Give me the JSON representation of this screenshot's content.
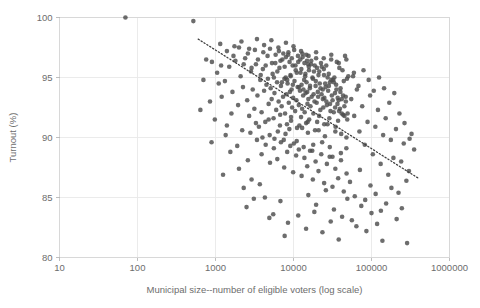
{
  "chart_data": {
    "type": "scatter",
    "title": "",
    "xlabel": "Municipal size--number of eligible voters (log scale)",
    "ylabel": "Turnout (%)",
    "xscale": "log",
    "yscale": "linear",
    "xlim": [
      10,
      1000000
    ],
    "ylim": [
      80,
      100
    ],
    "grid": true,
    "legend": null,
    "xticks": [
      10,
      100,
      1000,
      10000,
      100000,
      1000000
    ],
    "xtick_labels": [
      "10",
      "100",
      "1000",
      "10000",
      "100000",
      "1000000"
    ],
    "yticks": [
      80,
      85,
      90,
      95,
      100
    ],
    "ytick_labels": [
      "80",
      "95",
      "90",
      "95",
      "100"
    ],
    "ytick_labels_display": [
      "80",
      "85",
      "90",
      "95",
      "100"
    ],
    "marker": {
      "shape": "circle",
      "color": "#4d4d4d",
      "opacity": 0.82,
      "size_px": 4.6
    },
    "trendline": {
      "style": "dotted",
      "color": "#3d3d3d",
      "x_start": 600,
      "y_start": 98.2,
      "x_end": 400000,
      "y_end": 86.6,
      "description": "negative linear fit on log(size)"
    },
    "points": [
      [
        70,
        100.0
      ],
      [
        520,
        99.7
      ],
      [
        900,
        96.3
      ],
      [
        1050,
        95.4
      ],
      [
        1180,
        96.0
      ],
      [
        1320,
        94.7
      ],
      [
        1500,
        95.9
      ],
      [
        1650,
        93.8
      ],
      [
        1800,
        96.4
      ],
      [
        1950,
        92.7
      ],
      [
        2100,
        95.1
      ],
      [
        2250,
        94.2
      ],
      [
        2400,
        96.6
      ],
      [
        2550,
        93.1
      ],
      [
        2700,
        91.8
      ],
      [
        2850,
        95.5
      ],
      [
        3000,
        94.0
      ],
      [
        3150,
        92.4
      ],
      [
        3300,
        96.1
      ],
      [
        3450,
        93.5
      ],
      [
        3600,
        90.9
      ],
      [
        3750,
        94.8
      ],
      [
        3900,
        92.1
      ],
      [
        4050,
        95.7
      ],
      [
        4200,
        93.9
      ],
      [
        4350,
        91.3
      ],
      [
        4500,
        94.4
      ],
      [
        4650,
        96.8
      ],
      [
        4800,
        92.8
      ],
      [
        4950,
        90.2
      ],
      [
        5100,
        94.1
      ],
      [
        5250,
        93.2
      ],
      [
        5400,
        95.3
      ],
      [
        5550,
        91.6
      ],
      [
        5700,
        93.7
      ],
      [
        5850,
        96.2
      ],
      [
        6000,
        92.3
      ],
      [
        6150,
        94.6
      ],
      [
        6300,
        90.5
      ],
      [
        6450,
        93.0
      ],
      [
        6600,
        95.8
      ],
      [
        6750,
        91.9
      ],
      [
        6900,
        94.3
      ],
      [
        7050,
        92.6
      ],
      [
        7200,
        96.5
      ],
      [
        7350,
        93.4
      ],
      [
        7500,
        89.8
      ],
      [
        7650,
        94.9
      ],
      [
        7800,
        92.0
      ],
      [
        7950,
        95.0
      ],
      [
        8100,
        93.6
      ],
      [
        8250,
        91.1
      ],
      [
        8400,
        94.5
      ],
      [
        8550,
        96.9
      ],
      [
        8700,
        92.9
      ],
      [
        8850,
        90.7
      ],
      [
        9000,
        93.8
      ],
      [
        9150,
        95.2
      ],
      [
        9300,
        91.4
      ],
      [
        9450,
        94.0
      ],
      [
        9600,
        92.5
      ],
      [
        9750,
        96.0
      ],
      [
        9900,
        93.3
      ],
      [
        10100,
        89.5
      ],
      [
        10300,
        94.7
      ],
      [
        10500,
        92.2
      ],
      [
        10700,
        95.6
      ],
      [
        10900,
        93.1
      ],
      [
        11100,
        90.8
      ],
      [
        11300,
        94.2
      ],
      [
        11500,
        96.3
      ],
      [
        11700,
        92.7
      ],
      [
        11900,
        91.0
      ],
      [
        12100,
        93.9
      ],
      [
        12300,
        95.4
      ],
      [
        12500,
        91.7
      ],
      [
        12700,
        94.4
      ],
      [
        12900,
        92.4
      ],
      [
        13100,
        96.7
      ],
      [
        13300,
        93.5
      ],
      [
        13500,
        89.2
      ],
      [
        13700,
        94.8
      ],
      [
        13900,
        92.1
      ],
      [
        14100,
        95.1
      ],
      [
        14300,
        93.7
      ],
      [
        14500,
        91.2
      ],
      [
        14700,
        94.6
      ],
      [
        14900,
        96.4
      ],
      [
        15100,
        92.8
      ],
      [
        15300,
        90.4
      ],
      [
        15500,
        93.2
      ],
      [
        15700,
        95.9
      ],
      [
        15900,
        91.5
      ],
      [
        16200,
        94.1
      ],
      [
        16500,
        92.6
      ],
      [
        16800,
        96.1
      ],
      [
        17100,
        93.4
      ],
      [
        17400,
        88.9
      ],
      [
        17700,
        94.9
      ],
      [
        18000,
        92.0
      ],
      [
        18300,
        95.5
      ],
      [
        18600,
        93.0
      ],
      [
        18900,
        90.6
      ],
      [
        19200,
        94.3
      ],
      [
        19500,
        96.6
      ],
      [
        19800,
        92.9
      ],
      [
        20100,
        91.3
      ],
      [
        20500,
        93.8
      ],
      [
        20900,
        95.2
      ],
      [
        21300,
        91.8
      ],
      [
        21700,
        94.5
      ],
      [
        22100,
        92.3
      ],
      [
        22500,
        96.2
      ],
      [
        22900,
        93.6
      ],
      [
        23300,
        89.6
      ],
      [
        23700,
        94.0
      ],
      [
        24100,
        92.5
      ],
      [
        24500,
        95.7
      ],
      [
        24900,
        93.3
      ],
      [
        25300,
        90.1
      ],
      [
        25800,
        94.2
      ],
      [
        26300,
        96.0
      ],
      [
        26800,
        92.7
      ],
      [
        27300,
        91.1
      ],
      [
        27800,
        93.9
      ],
      [
        28300,
        95.3
      ],
      [
        28800,
        91.6
      ],
      [
        29300,
        94.6
      ],
      [
        29800,
        92.2
      ],
      [
        30400,
        96.5
      ],
      [
        31000,
        93.5
      ],
      [
        31600,
        88.4
      ],
      [
        32200,
        94.8
      ],
      [
        32800,
        92.1
      ],
      [
        33400,
        95.0
      ],
      [
        34000,
        93.7
      ],
      [
        34600,
        90.9
      ],
      [
        35200,
        94.4
      ],
      [
        35900,
        96.3
      ],
      [
        36600,
        92.8
      ],
      [
        37300,
        91.4
      ],
      [
        38000,
        93.1
      ],
      [
        38700,
        95.8
      ],
      [
        39400,
        92.4
      ],
      [
        40100,
        94.1
      ],
      [
        40900,
        90.3
      ],
      [
        41700,
        93.2
      ],
      [
        42500,
        95.6
      ],
      [
        43300,
        91.9
      ],
      [
        44100,
        94.7
      ],
      [
        44900,
        92.6
      ],
      [
        45800,
        96.8
      ],
      [
        46700,
        93.4
      ],
      [
        47600,
        89.1
      ],
      [
        48500,
        94.9
      ],
      [
        49400,
        92.0
      ],
      [
        50400,
        95.1
      ],
      [
        1400,
        97.2
      ],
      [
        1700,
        96.8
      ],
      [
        2000,
        97.5
      ],
      [
        2300,
        96.1
      ],
      [
        2600,
        97.0
      ],
      [
        2900,
        95.8
      ],
      [
        3200,
        97.3
      ],
      [
        3500,
        96.5
      ],
      [
        3800,
        95.2
      ],
      [
        4100,
        97.1
      ],
      [
        4400,
        96.0
      ],
      [
        4700,
        94.9
      ],
      [
        5000,
        97.4
      ],
      [
        5300,
        96.2
      ],
      [
        5600,
        95.0
      ],
      [
        5900,
        96.9
      ],
      [
        6200,
        95.5
      ],
      [
        6500,
        97.2
      ],
      [
        6800,
        96.4
      ],
      [
        7100,
        94.6
      ],
      [
        7400,
        97.0
      ],
      [
        7700,
        95.9
      ],
      [
        8000,
        96.7
      ],
      [
        8300,
        94.8
      ],
      [
        8600,
        97.1
      ],
      [
        8900,
        96.3
      ],
      [
        9200,
        95.1
      ],
      [
        9500,
        96.6
      ],
      [
        9800,
        94.4
      ],
      [
        10200,
        97.3
      ],
      [
        10600,
        96.0
      ],
      [
        11000,
        95.4
      ],
      [
        11400,
        96.8
      ],
      [
        11800,
        94.2
      ],
      [
        12200,
        96.5
      ],
      [
        12600,
        95.7
      ],
      [
        13000,
        97.0
      ],
      [
        13400,
        94.0
      ],
      [
        13800,
        96.2
      ],
      [
        14200,
        95.3
      ],
      [
        14600,
        96.9
      ],
      [
        15000,
        93.8
      ],
      [
        15400,
        96.1
      ],
      [
        15800,
        95.6
      ],
      [
        16300,
        94.3
      ],
      [
        16900,
        96.4
      ],
      [
        17500,
        95.0
      ],
      [
        18100,
        93.6
      ],
      [
        18700,
        96.0
      ],
      [
        19300,
        94.7
      ],
      [
        20000,
        95.8
      ],
      [
        20700,
        93.4
      ],
      [
        21400,
        95.5
      ],
      [
        22200,
        94.1
      ],
      [
        23000,
        95.9
      ],
      [
        23800,
        93.2
      ],
      [
        24600,
        95.2
      ],
      [
        25500,
        94.5
      ],
      [
        26400,
        93.0
      ],
      [
        27400,
        95.0
      ],
      [
        28400,
        94.3
      ],
      [
        29400,
        92.8
      ],
      [
        30500,
        94.8
      ],
      [
        31700,
        93.1
      ],
      [
        32900,
        94.6
      ],
      [
        34200,
        92.5
      ],
      [
        35500,
        94.0
      ],
      [
        36900,
        93.3
      ],
      [
        38400,
        92.2
      ],
      [
        39900,
        93.8
      ],
      [
        41500,
        92.0
      ],
      [
        43200,
        93.5
      ],
      [
        45000,
        91.8
      ],
      [
        46900,
        93.0
      ],
      [
        48900,
        91.5
      ],
      [
        3400,
        89.8
      ],
      [
        3900,
        88.6
      ],
      [
        4400,
        89.4
      ],
      [
        5000,
        87.9
      ],
      [
        5600,
        89.1
      ],
      [
        6200,
        88.2
      ],
      [
        6900,
        89.6
      ],
      [
        7600,
        87.5
      ],
      [
        8300,
        88.8
      ],
      [
        9100,
        89.3
      ],
      [
        9900,
        87.1
      ],
      [
        10800,
        88.5
      ],
      [
        11700,
        89.0
      ],
      [
        12700,
        86.8
      ],
      [
        13800,
        88.3
      ],
      [
        15000,
        87.6
      ],
      [
        16300,
        88.9
      ],
      [
        17700,
        86.5
      ],
      [
        19200,
        88.0
      ],
      [
        20900,
        87.2
      ],
      [
        22700,
        88.6
      ],
      [
        24700,
        86.2
      ],
      [
        26800,
        87.8
      ],
      [
        29100,
        88.4
      ],
      [
        31600,
        85.9
      ],
      [
        34400,
        87.4
      ],
      [
        37400,
        86.6
      ],
      [
        40600,
        88.1
      ],
      [
        44100,
        85.5
      ],
      [
        47900,
        87.0
      ],
      [
        2800,
        90.4
      ],
      [
        3300,
        91.2
      ],
      [
        4000,
        90.0
      ],
      [
        4800,
        91.5
      ],
      [
        5700,
        89.9
      ],
      [
        6700,
        91.0
      ],
      [
        7900,
        90.3
      ],
      [
        9300,
        91.7
      ],
      [
        11000,
        89.7
      ],
      [
        12900,
        90.8
      ],
      [
        15200,
        91.3
      ],
      [
        17900,
        89.4
      ],
      [
        21000,
        90.6
      ],
      [
        24800,
        91.1
      ],
      [
        29200,
        89.2
      ],
      [
        34400,
        90.5
      ],
      [
        40500,
        88.7
      ],
      [
        47700,
        90.0
      ],
      [
        55000,
        93.2
      ],
      [
        60000,
        91.8
      ],
      [
        65000,
        94.0
      ],
      [
        70000,
        90.5
      ],
      [
        76000,
        92.6
      ],
      [
        82000,
        89.4
      ],
      [
        89000,
        91.3
      ],
      [
        96000,
        93.5
      ],
      [
        104000,
        88.6
      ],
      [
        112000,
        90.9
      ],
      [
        121000,
        92.3
      ],
      [
        131000,
        87.8
      ],
      [
        141000,
        90.2
      ],
      [
        152000,
        91.6
      ],
      [
        164000,
        86.9
      ],
      [
        177000,
        89.8
      ],
      [
        191000,
        88.3
      ],
      [
        206000,
        90.7
      ],
      [
        222000,
        85.4
      ],
      [
        240000,
        88.0
      ],
      [
        259000,
        89.5
      ],
      [
        280000,
        86.4
      ],
      [
        302000,
        87.2
      ],
      [
        326000,
        90.3
      ],
      [
        352000,
        89.0
      ],
      [
        58000,
        95.1
      ],
      [
        68000,
        94.3
      ],
      [
        79000,
        95.6
      ],
      [
        92000,
        94.8
      ],
      [
        107000,
        93.9
      ],
      [
        125000,
        95.0
      ],
      [
        145000,
        94.1
      ],
      [
        169000,
        92.9
      ],
      [
        196000,
        93.7
      ],
      [
        228000,
        92.0
      ],
      [
        265000,
        91.2
      ],
      [
        308000,
        89.9
      ],
      [
        53000,
        86.3
      ],
      [
        61000,
        85.1
      ],
      [
        71000,
        87.3
      ],
      [
        83000,
        84.8
      ],
      [
        97000,
        86.0
      ],
      [
        113000,
        85.3
      ],
      [
        132000,
        83.9
      ],
      [
        154000,
        84.5
      ],
      [
        180000,
        85.8
      ],
      [
        210000,
        83.2
      ],
      [
        245000,
        84.1
      ],
      [
        286000,
        81.2
      ],
      [
        1200,
        93.4
      ],
      [
        1600,
        92.0
      ],
      [
        2200,
        90.6
      ],
      [
        1900,
        89.3
      ],
      [
        2600,
        88.1
      ],
      [
        1400,
        91.0
      ],
      [
        1100,
        94.5
      ],
      [
        2000,
        87.4
      ],
      [
        2900,
        86.5
      ],
      [
        2300,
        85.8
      ],
      [
        3100,
        84.9
      ],
      [
        3700,
        86.1
      ],
      [
        2500,
        84.2
      ],
      [
        4300,
        85.0
      ],
      [
        5500,
        83.6
      ],
      [
        6800,
        84.7
      ],
      [
        8500,
        82.9
      ],
      [
        4900,
        83.3
      ],
      [
        7700,
        81.8
      ],
      [
        11500,
        83.5
      ],
      [
        14500,
        82.4
      ],
      [
        18500,
        83.8
      ],
      [
        23500,
        82.1
      ],
      [
        30000,
        83.0
      ],
      [
        38000,
        81.5
      ],
      [
        15500,
        85.2
      ],
      [
        19500,
        84.4
      ],
      [
        26000,
        85.6
      ],
      [
        33000,
        84.0
      ],
      [
        42000,
        83.4
      ],
      [
        49000,
        84.9
      ],
      [
        56000,
        83.1
      ],
      [
        64000,
        82.6
      ],
      [
        74000,
        84.3
      ],
      [
        86000,
        82.2
      ],
      [
        100000,
        83.7
      ],
      [
        118000,
        82.8
      ],
      [
        138000,
        81.4
      ],
      [
        700,
        94.8
      ],
      [
        850,
        93.0
      ],
      [
        980,
        91.5
      ],
      [
        1150,
        97.8
      ],
      [
        1350,
        90.2
      ],
      [
        1550,
        88.8
      ],
      [
        760,
        96.5
      ],
      [
        640,
        92.3
      ],
      [
        890,
        89.6
      ],
      [
        1250,
        86.9
      ],
      [
        1750,
        97.6
      ],
      [
        2150,
        98.0
      ],
      [
        2700,
        97.4
      ],
      [
        3400,
        98.2
      ],
      [
        4200,
        97.7
      ],
      [
        5200,
        98.1
      ],
      [
        6400,
        97.5
      ],
      [
        8000,
        97.9
      ],
      [
        10000,
        97.6
      ],
      [
        12500,
        97.2
      ],
      [
        15600,
        96.8
      ],
      [
        19500,
        97.1
      ],
      [
        24400,
        96.6
      ],
      [
        30500,
        96.9
      ],
      [
        38100,
        96.2
      ],
      [
        47600,
        96.5
      ],
      [
        59500,
        95.4
      ]
    ]
  }
}
